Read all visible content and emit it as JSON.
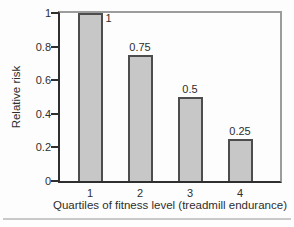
{
  "chart_data": {
    "type": "bar",
    "categories": [
      "1",
      "2",
      "3",
      "4"
    ],
    "values": [
      1,
      0.75,
      0.5,
      0.25
    ],
    "bar_labels": [
      "1",
      "0.75",
      "0.5",
      "0.25"
    ],
    "title": "",
    "xlabel": "Quartiles of fitness level (treadmill endurance)",
    "ylabel": "Relative risk",
    "ylim": [
      0,
      1
    ],
    "ytick_labels": [
      "1",
      "0.8",
      "0.6",
      "0.4",
      "0.2",
      "0"
    ],
    "grid": false,
    "legend": false
  },
  "colors": {
    "bar_fill": "#c7c7c7",
    "bar_border": "#4d4d4d",
    "axis": "#2f2f2f",
    "frame": "#9c9c9c",
    "text": "#2e2e2e",
    "divider": "#c9c9c9",
    "background": "#fdfdfd"
  }
}
